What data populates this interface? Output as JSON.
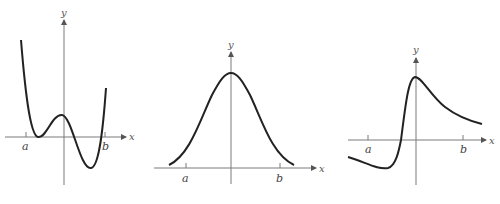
{
  "graphs": [
    {
      "id": "graph-1",
      "description": "Quartic-like curve with a double root near left, local max above x-axis, local min below, rising steeply at right",
      "x_axis_label": "x",
      "y_axis_label": "y",
      "tick_labels": [
        "a",
        "b"
      ]
    },
    {
      "id": "graph-2",
      "description": "Bell-shaped curve symmetric about the y-axis, always positive",
      "x_axis_label": "x",
      "y_axis_label": "y",
      "tick_labels": [
        "a",
        "b"
      ]
    },
    {
      "id": "graph-3",
      "description": "Curve starting below x-axis, dipping to a minimum, rising sharply to a peak at the y-axis, then decaying toward a positive value",
      "x_axis_label": "x",
      "y_axis_label": "y",
      "tick_labels": [
        "a",
        "b"
      ]
    }
  ],
  "colors": {
    "curve": "#222222",
    "axis": "#7a7a7a",
    "label": "#444444"
  }
}
